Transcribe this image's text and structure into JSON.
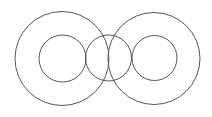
{
  "canvas": {
    "width": 212,
    "height": 117,
    "background": "#ffffff"
  },
  "stroke_color": "#555555",
  "circles": [
    {
      "name": "left-outer-circle",
      "cx": 62,
      "cy": 58.5,
      "r": 47
    },
    {
      "name": "left-inner-circle",
      "cx": 62.5,
      "cy": 58.5,
      "r": 23.5
    },
    {
      "name": "middle-circle",
      "cx": 108.5,
      "cy": 58,
      "r": 23
    },
    {
      "name": "right-outer-circle",
      "cx": 154,
      "cy": 58.5,
      "r": 46
    },
    {
      "name": "right-inner-circle",
      "cx": 154.5,
      "cy": 58,
      "r": 22.5
    }
  ]
}
